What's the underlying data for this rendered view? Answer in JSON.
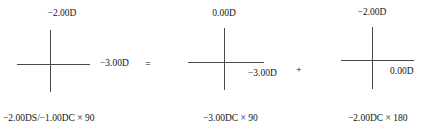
{
  "figure": {
    "type": "optical-cross-diagram",
    "equation_operators": {
      "equals": "=",
      "plus": "+"
    },
    "crosses": [
      {
        "id": "cross-1",
        "vertical_meridian_power": "−2.00D",
        "horizontal_meridian_power": "−3.00D",
        "prescription": "−2.00DS/−1.00DC × 90"
      },
      {
        "id": "cross-2",
        "vertical_meridian_power": "0.00D",
        "horizontal_meridian_power": "−3.00D",
        "prescription": "−3.00DC × 90"
      },
      {
        "id": "cross-3",
        "vertical_meridian_power": "−2.00D",
        "horizontal_meridian_power": "0.00D",
        "prescription": "−2.00DC × 180"
      }
    ]
  }
}
